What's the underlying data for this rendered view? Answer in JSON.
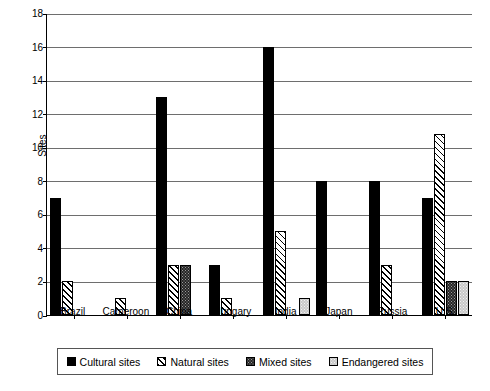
{
  "chart_data": {
    "type": "bar",
    "title": "",
    "xlabel": "",
    "ylabel": "Sites",
    "ylim": [
      0,
      18
    ],
    "ytick_step": 2,
    "yticks": [
      0,
      2,
      4,
      6,
      8,
      10,
      12,
      14,
      16,
      18
    ],
    "grid": true,
    "legend_position": "below",
    "categories": [
      "Brazil",
      "Cameroon",
      "China",
      "Hungary",
      "India",
      "Japan",
      "Russia",
      "U.S."
    ],
    "series": [
      {
        "name": "Cultural sites",
        "fill": "cultural",
        "color": "#000000",
        "values": [
          7,
          0,
          13,
          3,
          16,
          8,
          8,
          7
        ]
      },
      {
        "name": "Natural sites",
        "fill": "natural",
        "color": "#ffffff",
        "values": [
          2,
          1,
          3,
          1,
          5,
          0,
          3,
          10.8
        ]
      },
      {
        "name": "Mixed sites",
        "fill": "mixed",
        "color": "#262626",
        "values": [
          0,
          0,
          3,
          0,
          0,
          0,
          0,
          2
        ]
      },
      {
        "name": "Endangered sites",
        "fill": "endangered",
        "color": "#c9c9c9",
        "values": [
          0,
          0,
          0,
          0,
          1,
          0,
          0,
          2
        ]
      }
    ]
  },
  "legend": {
    "items": [
      {
        "label": "Cultural sites"
      },
      {
        "label": "Natural sites"
      },
      {
        "label": "Mixed sites"
      },
      {
        "label": "Endangered sites"
      }
    ]
  }
}
